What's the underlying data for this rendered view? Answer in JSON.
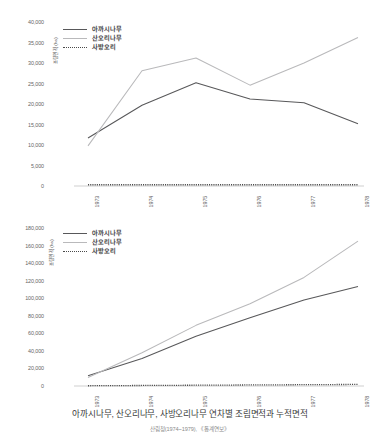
{
  "caption": {
    "main": "아까시나무, 산오리나무, 사방오리나무 연차별 조림면적과 누적면적",
    "source": "산림청(1974~1979), 《통계연보》"
  },
  "legend": {
    "items": [
      {
        "label": "아까시나무",
        "style": "solid-dark",
        "color": "#58585a"
      },
      {
        "label": "산오리나무",
        "style": "solid-light",
        "color": "#b9b9bb"
      },
      {
        "label": "사방오리",
        "style": "dotted",
        "color": "#4a4a4a"
      }
    ]
  },
  "chart_data": [
    {
      "type": "line",
      "id": "annual-planting-area",
      "title": "",
      "xlabel": "",
      "ylabel": "조림면적 (ha)",
      "categories": [
        "1973",
        "1974",
        "1975",
        "1976",
        "1977",
        "1978"
      ],
      "x": [
        1973,
        1974,
        1975,
        1976,
        1977,
        1978
      ],
      "ylim": [
        0,
        40000
      ],
      "yticks": [
        "0",
        "5,000",
        "10,000",
        "15,000",
        "20,000",
        "25,000",
        "30,000",
        "35,000",
        "40,000"
      ],
      "ytick_values": [
        0,
        5000,
        10000,
        15000,
        20000,
        25000,
        30000,
        35000,
        40000
      ],
      "grid": false,
      "legend_position": "top-left",
      "series": [
        {
          "name": "아까시나무",
          "color": "#58585a",
          "style": "solid",
          "values": [
            11700,
            19700,
            25200,
            21200,
            20300,
            15200
          ]
        },
        {
          "name": "산오리나무",
          "color": "#b9b9bb",
          "style": "solid",
          "values": [
            9800,
            28100,
            31200,
            24600,
            30000,
            36200
          ]
        },
        {
          "name": "사방오리",
          "color": "#4a4a4a",
          "style": "dotted",
          "values": [
            300,
            300,
            300,
            300,
            300,
            300
          ]
        }
      ]
    },
    {
      "type": "line",
      "id": "cumulative-planting-area",
      "title": "",
      "xlabel": "",
      "ylabel": "조림면적 (ha)",
      "categories": [
        "1973",
        "1974",
        "1975",
        "1976",
        "1977",
        "1978"
      ],
      "x": [
        1973,
        1974,
        1975,
        1976,
        1977,
        1978
      ],
      "ylim": [
        0,
        180000
      ],
      "yticks": [
        "0",
        "20,000",
        "40,000",
        "60,000",
        "80,000",
        "100,000",
        "120,000",
        "140,000",
        "160,000",
        "180,000"
      ],
      "ytick_values": [
        0,
        20000,
        40000,
        60000,
        80000,
        100000,
        120000,
        140000,
        160000,
        180000
      ],
      "grid": false,
      "legend_position": "top-left",
      "series": [
        {
          "name": "아까시나무",
          "color": "#58585a",
          "style": "solid",
          "values": [
            11700,
            31400,
            56600,
            77800,
            98100,
            113300
          ]
        },
        {
          "name": "산오리나무",
          "color": "#b9b9bb",
          "style": "solid",
          "values": [
            9800,
            37900,
            69100,
            93700,
            123700,
            165000
          ]
        },
        {
          "name": "사방오리",
          "color": "#4a4a4a",
          "style": "dotted",
          "values": [
            300,
            600,
            900,
            1200,
            1500,
            1800
          ]
        }
      ]
    }
  ]
}
